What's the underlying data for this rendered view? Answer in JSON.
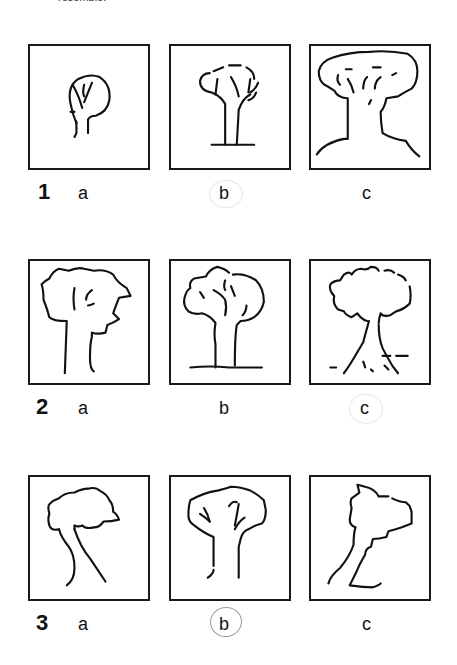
{
  "header": {
    "clipped_text": "resemble."
  },
  "rows": [
    {
      "number": "1",
      "options": [
        {
          "letter": "a",
          "circled": false
        },
        {
          "letter": "b",
          "circled": true,
          "circle_style": "faint"
        },
        {
          "letter": "c",
          "circled": false
        }
      ]
    },
    {
      "number": "2",
      "options": [
        {
          "letter": "a",
          "circled": false
        },
        {
          "letter": "b",
          "circled": false
        },
        {
          "letter": "c",
          "circled": true,
          "circle_style": "faint"
        }
      ]
    },
    {
      "number": "3",
      "options": [
        {
          "letter": "a",
          "circled": false
        },
        {
          "letter": "b",
          "circled": true,
          "circle_style": "pencil"
        },
        {
          "letter": "c",
          "circled": false
        }
      ]
    }
  ],
  "icons": {
    "1a": "tree-small-round-crown-icon",
    "1b": "tree-bushy-with-ground-line-icon",
    "1c": "tree-large-crown-wide-trunk-icon",
    "2a": "tree-jagged-crown-icon",
    "2b": "tree-cloud-crown-with-ground-icon",
    "2c": "tree-with-roots-icon",
    "3a": "tree-leaning-trunk-icon",
    "3b": "tree-flat-crown-straight-trunk-icon",
    "3c": "tree-angular-crown-icon"
  }
}
